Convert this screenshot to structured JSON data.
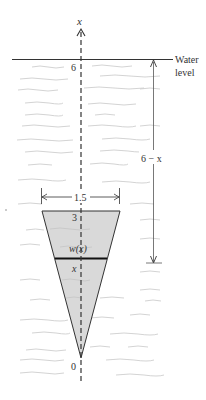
{
  "diagram": {
    "axis_label": "x",
    "water_label_line1": "Water",
    "water_label_line2": "level",
    "water_level_value": "6",
    "depth_label": "6 − x",
    "width_top_label": "1.5",
    "top_value": "3",
    "strip_width_label": "w(x)",
    "strip_position_label": "x",
    "bottom_value": "0",
    "colors": {
      "line": "#333333",
      "wave": "#c8c8c8",
      "plate_fill": "#d9d9d9"
    }
  }
}
